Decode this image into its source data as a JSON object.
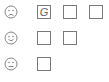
{
  "rows": [
    {
      "face": "sad-face-icon",
      "boxes": [
        "G",
        "",
        ""
      ]
    },
    {
      "face": "happy-face-icon",
      "boxes": [
        "",
        ""
      ]
    },
    {
      "face": "neutral-face-icon",
      "boxes": [
        ""
      ]
    }
  ],
  "colors": {
    "stroke": "#7a7a7a",
    "background": "#ffffff"
  }
}
